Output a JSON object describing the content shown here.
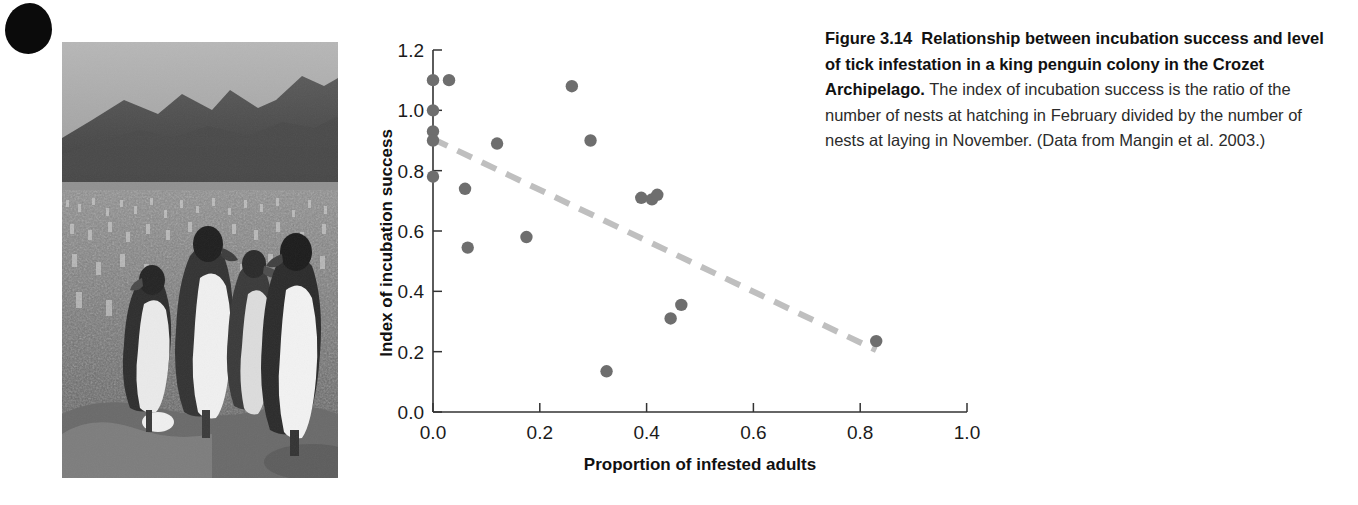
{
  "figure": {
    "label": "Figure 3.14",
    "title_bold": "Relationship between incubation success and level of tick infestation in a king penguin colony in the Crozet Archipelago.",
    "body": " The index of incubation success is the ratio of the number of nests at hatching in February divided by the number of nests at laying in November. (Data from Mangin et al. 2003.)"
  },
  "photo": {
    "alt": "Black and white photograph of king penguins in a large colony with mountains behind",
    "caption": ""
  },
  "chart_data": {
    "type": "scatter",
    "title": "",
    "xlabel": "Proportion of infested adults",
    "ylabel": "Index of incubation success",
    "xlim": [
      0.0,
      1.0
    ],
    "ylim": [
      0.0,
      1.2
    ],
    "xticks": [
      "0.0",
      "0.2",
      "0.4",
      "0.6",
      "0.8",
      "1.0"
    ],
    "xtick_values": [
      0.0,
      0.2,
      0.4,
      0.6,
      0.8,
      1.0
    ],
    "yticks": [
      "0.0",
      "0.2",
      "0.4",
      "0.6",
      "0.8",
      "1.0",
      "1.2"
    ],
    "ytick_values": [
      0.0,
      0.2,
      0.4,
      0.6,
      0.8,
      1.0,
      1.2
    ],
    "grid": false,
    "legend": "none",
    "marker_color": "#6e6e6e",
    "trendline_color": "#bfbfbf",
    "points": [
      {
        "x": 0.0,
        "y": 1.1
      },
      {
        "x": 0.03,
        "y": 1.1
      },
      {
        "x": 0.0,
        "y": 1.0
      },
      {
        "x": 0.0,
        "y": 0.93
      },
      {
        "x": 0.0,
        "y": 0.9
      },
      {
        "x": 0.0,
        "y": 0.78
      },
      {
        "x": 0.06,
        "y": 0.74
      },
      {
        "x": 0.065,
        "y": 0.545
      },
      {
        "x": 0.12,
        "y": 0.89
      },
      {
        "x": 0.175,
        "y": 0.58
      },
      {
        "x": 0.26,
        "y": 1.08
      },
      {
        "x": 0.295,
        "y": 0.9
      },
      {
        "x": 0.325,
        "y": 0.135
      },
      {
        "x": 0.39,
        "y": 0.71
      },
      {
        "x": 0.41,
        "y": 0.705
      },
      {
        "x": 0.42,
        "y": 0.72
      },
      {
        "x": 0.445,
        "y": 0.31
      },
      {
        "x": 0.465,
        "y": 0.355
      },
      {
        "x": 0.83,
        "y": 0.235
      }
    ],
    "trendline": {
      "type": "dashed-linear-fit",
      "x_start": 0.0,
      "y_start": 0.905,
      "x_end": 0.83,
      "y_end": 0.205
    }
  }
}
